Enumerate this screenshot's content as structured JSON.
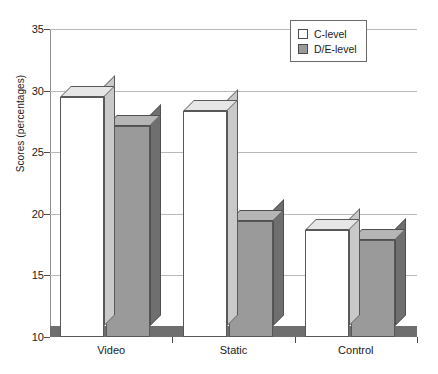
{
  "chart_data": {
    "type": "bar",
    "title": "",
    "subtitle": "",
    "xlabel": "",
    "ylabel": "Scores (percentages)",
    "categories": [
      "Video",
      "Static",
      "Control"
    ],
    "series": [
      {
        "name": "C-level",
        "values": [
          30.4,
          29.2,
          19.6
        ]
      },
      {
        "name": "D/E-level",
        "values": [
          28.0,
          20.3,
          18.8
        ]
      }
    ],
    "ylim": [
      10,
      35
    ],
    "yticks": [
      10,
      15,
      20,
      25,
      30,
      35
    ],
    "ytick_labels": [
      "10",
      "15",
      "20",
      "25",
      "30",
      "35"
    ],
    "grid": true,
    "grid_axis": "y",
    "legend_position": "top-right",
    "style": "3d-column",
    "colors": {
      "c_level_fill": "#ffffff",
      "de_level_fill": "#9a9a9a",
      "bar_outline": "#585858",
      "gridline": "#b9b9b9",
      "axis": "#8d8d8d",
      "floor": "#6e6e6e",
      "text": "#1a1a1a"
    }
  },
  "legend": {
    "items": [
      {
        "label": "C-level",
        "swatch": "c"
      },
      {
        "label": "D/E-level",
        "swatch": "de"
      }
    ]
  }
}
